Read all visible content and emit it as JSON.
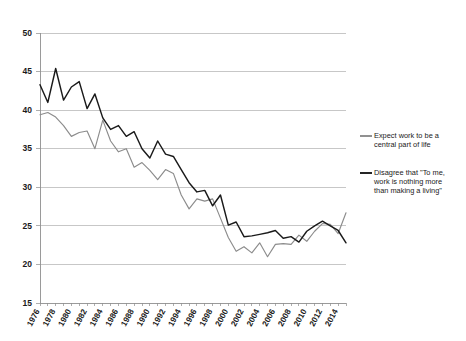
{
  "chart_data": {
    "type": "line",
    "title": "",
    "subtitle": "",
    "xlabel": "",
    "ylabel": "",
    "xlim": [
      1976,
      2015
    ],
    "ylim": [
      15,
      50
    ],
    "grid": true,
    "grid_axis": "y",
    "legend_position": "right",
    "y_ticks": [
      15,
      20,
      25,
      30,
      35,
      40,
      45,
      50
    ],
    "x_ticks": [
      1976,
      1978,
      1980,
      1982,
      1984,
      1986,
      1988,
      1990,
      1992,
      1994,
      1996,
      1998,
      2000,
      2002,
      2004,
      2006,
      2008,
      2010,
      2012,
      2014
    ],
    "x": [
      1976,
      1977,
      1978,
      1979,
      1980,
      1981,
      1982,
      1983,
      1984,
      1985,
      1986,
      1987,
      1988,
      1989,
      1990,
      1991,
      1992,
      1993,
      1994,
      1995,
      1996,
      1997,
      1998,
      1999,
      2000,
      2001,
      2002,
      2003,
      2004,
      2005,
      2006,
      2007,
      2008,
      2009,
      2010,
      2011,
      2012,
      2013,
      2014,
      2015
    ],
    "series": [
      {
        "name": "Expect work to be a central part of life",
        "color": "#8c8c8c",
        "values": [
          39.4,
          39.7,
          39.1,
          38.0,
          36.6,
          37.1,
          37.3,
          35.0,
          38.7,
          36.0,
          34.6,
          35.0,
          32.6,
          33.2,
          32.2,
          31.0,
          32.3,
          31.8,
          29.0,
          27.2,
          28.5,
          28.2,
          28.5,
          26.0,
          23.5,
          21.7,
          22.3,
          21.5,
          22.8,
          21.0,
          22.6,
          22.7,
          22.6,
          23.8,
          23.0,
          24.3,
          25.3,
          25.2,
          24.0,
          26.7
        ]
      },
      {
        "name": "Disagree that \"To me, work is nothing more than making a living\"",
        "color": "#1a1a1a",
        "values": [
          43.3,
          41.0,
          45.4,
          41.3,
          43.0,
          43.7,
          40.2,
          42.1,
          39.0,
          37.5,
          38.0,
          36.6,
          37.2,
          35.0,
          33.8,
          36.0,
          34.3,
          34.0,
          32.3,
          30.6,
          29.4,
          29.6,
          27.6,
          29.0,
          25.1,
          25.5,
          23.6,
          23.7,
          23.9,
          24.1,
          24.4,
          23.4,
          23.6,
          22.9,
          24.3,
          25.0,
          25.6,
          25.0,
          24.4,
          22.8
        ]
      }
    ],
    "legend": [
      {
        "swatch_color": "#8c8c8c",
        "line1": "Expect work to be a",
        "line2": "central part of life",
        "line3": ""
      },
      {
        "swatch_color": "#1a1a1a",
        "line1": "Disagree that \"To me,",
        "line2": "work is nothing more",
        "line3": "than making a living\""
      }
    ]
  }
}
